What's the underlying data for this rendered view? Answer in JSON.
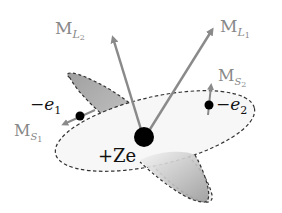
{
  "diagram": {
    "colors": {
      "arrow": "#8a8a8a",
      "label_gray": "#888888",
      "label_dark": "#111111",
      "orbit_dash": "#333333",
      "nucleus": "#000000",
      "electron": "#000000",
      "shade_dark": "#a8a8a8",
      "shade_light": "#f2f2f2"
    },
    "nucleus": {
      "label": "+Ze"
    },
    "electrons": [
      {
        "id": "e1",
        "label_main": "−e",
        "label_sub": "1",
        "spin_label_main": "M",
        "spin_label_sub": "S",
        "spin_label_subsub": "1"
      },
      {
        "id": "e2",
        "label_main": "−e",
        "label_sub": "2",
        "spin_label_main": "M",
        "spin_label_sub": "S",
        "spin_label_subsub": "2"
      }
    ],
    "orbital_moments": [
      {
        "id": "ML1",
        "label_main": "M",
        "label_sub": "L",
        "label_subsub": "1"
      },
      {
        "id": "ML2",
        "label_main": "M",
        "label_sub": "L",
        "label_subsub": "2"
      }
    ]
  }
}
